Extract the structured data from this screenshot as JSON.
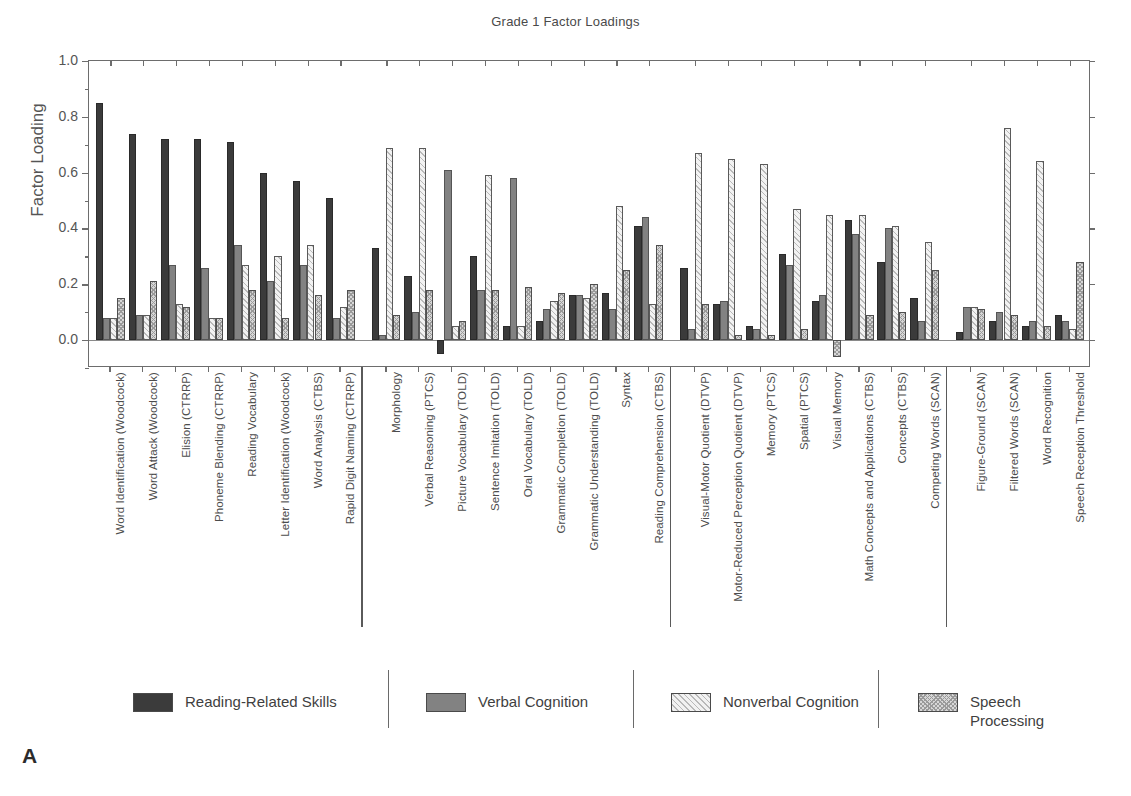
{
  "panel_label": "A",
  "chart_data": {
    "type": "bar",
    "title": "Grade 1 Factor Loadings",
    "xlabel": "",
    "ylabel": "Factor Loading",
    "ylim": [
      -0.1,
      1.0
    ],
    "yticks": [
      0.0,
      0.2,
      0.4,
      0.6,
      0.8,
      1.0
    ],
    "ytick_labels": [
      "0.0",
      "0.2",
      "0.4",
      "0.6",
      "0.8",
      "1.0"
    ],
    "grid": false,
    "legend_position": "bottom",
    "series": [
      {
        "name": "Reading-Related Skills",
        "color": "#3b3b3b",
        "pattern": "solid-dark",
        "values": [
          0.85,
          0.74,
          0.72,
          0.72,
          0.71,
          0.6,
          0.57,
          0.51,
          0.33,
          0.23,
          -0.05,
          0.3,
          0.05,
          0.07,
          0.16,
          0.17,
          0.41,
          0.26,
          0.13,
          0.05,
          0.31,
          0.14,
          0.43,
          0.28,
          0.15,
          0.03,
          0.07,
          0.05,
          0.09
        ]
      },
      {
        "name": "Verbal Cognition",
        "color": "#828282",
        "pattern": "solid-gray",
        "values": [
          0.08,
          0.09,
          0.27,
          0.26,
          0.34,
          0.21,
          0.27,
          0.08,
          0.02,
          0.1,
          0.61,
          0.18,
          0.58,
          0.11,
          0.16,
          0.11,
          0.44,
          0.04,
          0.14,
          0.04,
          0.27,
          0.16,
          0.38,
          0.4,
          0.07,
          0.12,
          0.1,
          0.07,
          0.07
        ]
      },
      {
        "name": "Nonverbal Cognition",
        "color": "#f2f2f2",
        "pattern": "diagonal-hatch",
        "values": [
          0.08,
          0.09,
          0.13,
          0.08,
          0.27,
          0.3,
          0.34,
          0.12,
          0.69,
          0.69,
          0.05,
          0.59,
          0.05,
          0.14,
          0.15,
          0.48,
          0.13,
          0.67,
          0.65,
          0.63,
          0.47,
          0.45,
          0.45,
          0.41,
          0.35,
          0.12,
          0.76,
          0.64,
          0.04
        ]
      },
      {
        "name": "Speech Processing",
        "color": "#d7d7d7",
        "pattern": "crosshatch",
        "values": [
          0.15,
          0.21,
          0.12,
          0.08,
          0.18,
          0.08,
          0.16,
          0.18,
          0.09,
          0.18,
          0.07,
          0.18,
          0.19,
          0.17,
          0.2,
          0.25,
          0.34,
          0.13,
          0.02,
          0.02,
          0.04,
          -0.06,
          0.09,
          0.1,
          0.25,
          0.11,
          0.09,
          0.05,
          0.28
        ]
      }
    ],
    "negative_overrides": [
      {
        "series": 0,
        "index": 10,
        "value": -0.05
      },
      {
        "series": 3,
        "index": 21,
        "value": -0.06
      },
      {
        "series": 3,
        "index": 7,
        "value": -0.03
      },
      {
        "series": 3,
        "index": 28,
        "value": 0.28
      }
    ],
    "categories": [
      "Word Identification (Woodcock)",
      "Word Attack (Woodcock)",
      "Elision (CTRRP)",
      "Phoneme Blending (CTRRP)",
      "Reading Vocabulary",
      "Letter Identification (Woodcock)",
      "Word Analysis (CTBS)",
      "Rapid Digit Naming (CTRRP)",
      "Morphology",
      "Verbal Reasoning (PTCS)",
      "Picture Vocabulary (TOLD)",
      "Sentence Imitation (TOLD)",
      "Oral Vocabulary (TOLD)",
      "Grammatic Completion (TOLD)",
      "Grammatic Understanding (TOLD)",
      "Syntax",
      "Reading Comprehension (CTBS)",
      "Visual-Motor Quotient (DTVP)",
      "Motor-Reduced Perception Quotient (DTVP)",
      "Memory (PTCS)",
      "Spatial (PTCS)",
      "Visual Memory",
      "Math Concepts and Applications (CTBS)",
      "Concepts (CTBS)",
      "Competing Words (SCAN)",
      "Figure-Ground (SCAN)",
      "Filtered Words (SCAN)",
      "Word Recognition",
      "Speech Reception Threshold"
    ],
    "group_breaks": [
      8,
      17,
      25
    ]
  },
  "legend": {
    "items": [
      {
        "label": "Reading-Related Skills"
      },
      {
        "label": "Verbal Cognition"
      },
      {
        "label": "Nonverbal Cognition"
      },
      {
        "label": "Speech\nProcessing"
      }
    ]
  }
}
